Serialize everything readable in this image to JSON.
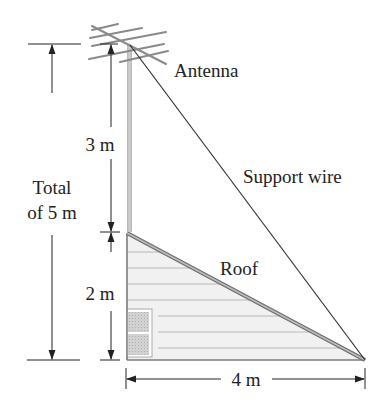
{
  "diagram": {
    "labels": {
      "antenna": "Antenna",
      "support_wire": "Support wire",
      "roof": "Roof",
      "upper_height": "3 m",
      "lower_height": "2 m",
      "total_line1": "Total",
      "total_line2": "of 5 m",
      "base_width": "4 m"
    },
    "colors": {
      "line": "#333333",
      "roof": "#8a8a8a",
      "wall_fill": "#f0f0f0",
      "siding": "#b5b5b5",
      "window_fill": "#c9c9c9"
    }
  }
}
